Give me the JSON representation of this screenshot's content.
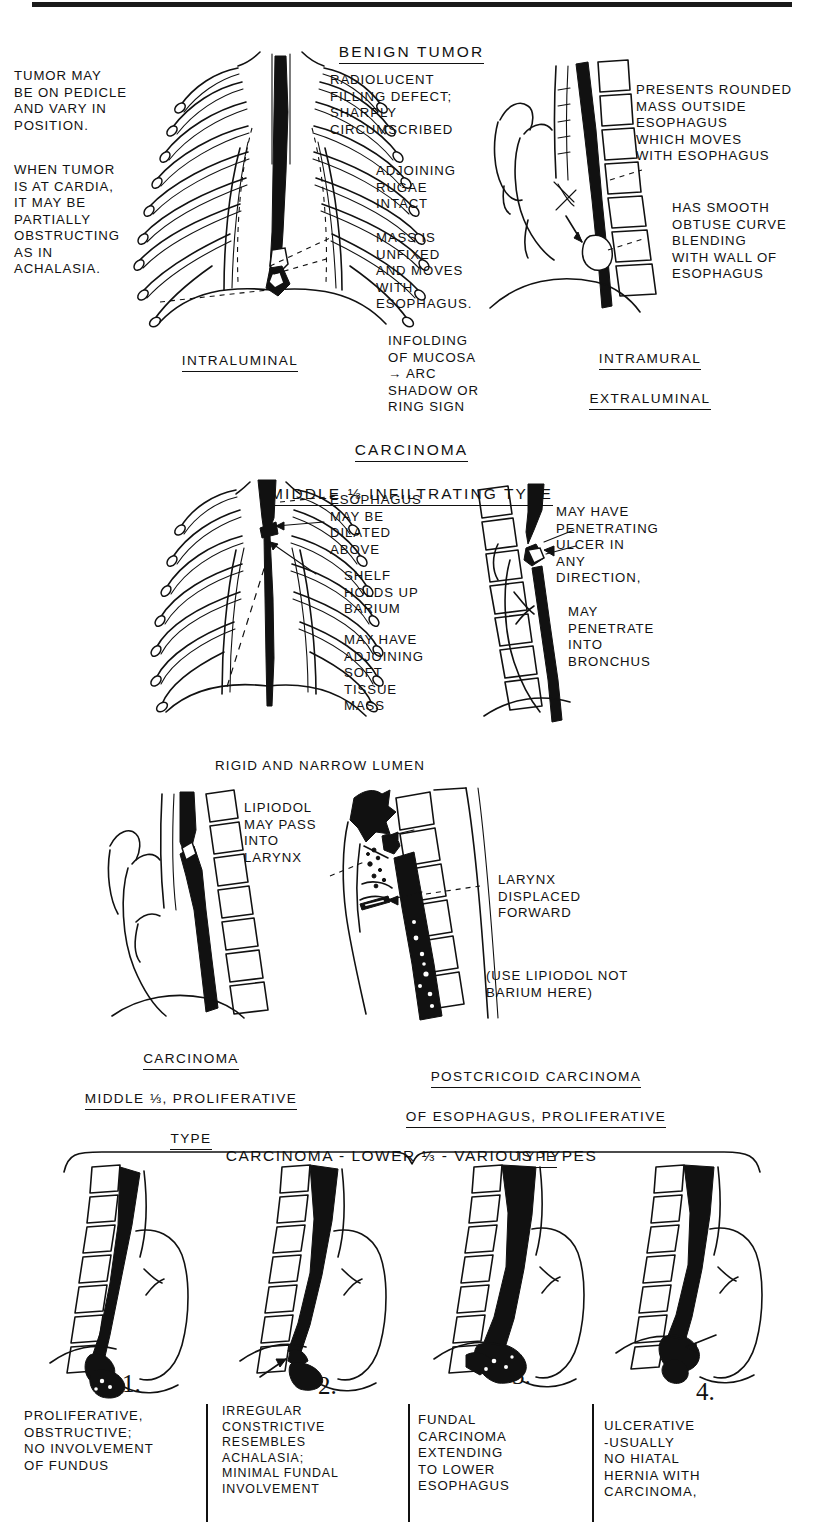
{
  "page": {
    "width": 823,
    "height": 1533,
    "ink_color": "#111111",
    "background": "#ffffff"
  },
  "sections": [
    {
      "id": "benign-tumor",
      "heading": "BENIGN  TUMOR",
      "panels": [
        {
          "id": "intraluminal",
          "caption": "INTRALUMINAL"
        },
        {
          "id": "intramural-extraluminal",
          "caption_line1": "INTRAMURAL",
          "caption_line2": "EXTRALUMINAL"
        }
      ],
      "annotations": [
        {
          "id": "tumor-pedicle",
          "text": "TUMOR MAY\nBE ON PEDICLE\nAND VARY IN\nPOSITION."
        },
        {
          "id": "tumor-cardia",
          "text": "WHEN TUMOR\nIS AT CARDIA,\nIT MAY BE\nPARTIALLY\nOBSTRUCTING\nAS IN\nACHALASIA."
        },
        {
          "id": "radiolucent",
          "text": "RADIOLUCENT\nFILLING DEFECT;\nSHARPLY\nCIRCUMSCRIBED"
        },
        {
          "id": "adjoining-rugae",
          "text": "ADJOINING\nRUGAE\nINTACT"
        },
        {
          "id": "mass-unfixed",
          "text": "MASS IS\nUNFIXED\nAND MOVES\nWITH\nESOPHAGUS."
        },
        {
          "id": "infolding-mucosa",
          "text": "INFOLDING\nOF MUCOSA\n→ ARC\nSHADOW OR\nRING SIGN"
        },
        {
          "id": "presents-rounded-mass",
          "text": "PRESENTS ROUNDED\nMASS OUTSIDE\nESOPHAGUS\nWHICH MOVES\nWITH ESOPHAGUS"
        },
        {
          "id": "smooth-obtuse-curve",
          "text": "HAS SMOOTH\nOBTUSE CURVE\nBLENDING\nWITH WALL OF\nESOPHAGUS"
        }
      ]
    },
    {
      "id": "carcinoma-middle-infiltrating",
      "heading_line1": "CARCINOMA",
      "heading_line2": "MIDDLE ⅓ INFILTRATING TYPE",
      "annotations": [
        {
          "id": "esophagus-dilated",
          "text": "ESOPHAGUS\nMAY BE\nDILATED\nABOVE"
        },
        {
          "id": "shelf-holds-barium",
          "text": "SHELF\nHOLDS UP\nBARIUM"
        },
        {
          "id": "soft-tissue-mass",
          "text": "MAY HAVE\nADJOINING\nSOFT\nTISSUE\nMASS"
        },
        {
          "id": "penetrating-ulcer",
          "text": "MAY HAVE\nPENETRATING\nULCER IN\nANY\nDIRECTION,"
        },
        {
          "id": "penetrate-bronchus",
          "text": "MAY\nPENETRATE\nINTO\nBRONCHUS"
        },
        {
          "id": "rigid-narrow-lumen",
          "text": "RIGID AND NARROW LUMEN"
        }
      ]
    },
    {
      "id": "carcinoma-proliferative",
      "panels": [
        {
          "id": "middle-third-proliferative",
          "caption_line1": "CARCINOMA",
          "caption_line2": "MIDDLE ⅓, PROLIFERATIVE",
          "caption_line3": "TYPE"
        },
        {
          "id": "postcricoid",
          "caption_line1": "POSTCRICOID CARCINOMA",
          "caption_line2": "OF ESOPHAGUS, PROLIFERATIVE",
          "caption_line3": "TYPE"
        }
      ],
      "annotations": [
        {
          "id": "lipiodol-larynx",
          "text": "LIPIODOL\nMAY PASS\nINTO\nLARYNX"
        },
        {
          "id": "larynx-displaced",
          "text": "LARYNX\nDISPLACED\nFORWARD"
        },
        {
          "id": "use-lipiodol-note",
          "text": "(USE LIPIODOL NOT\nBARIUM HERE)"
        }
      ]
    },
    {
      "id": "carcinoma-lower-third",
      "heading": "CARCINOMA - LOWER ⅓ - VARIOUS TYPES",
      "panels": [
        {
          "id": "lower-1",
          "number": "1.",
          "caption": "PROLIFERATIVE,\nOBSTRUCTIVE;\nNO INVOLVEMENT\nOF FUNDUS"
        },
        {
          "id": "lower-2",
          "number": "2.",
          "caption": "IRREGULAR\nCONSTRICTIVE\nRESEMBLES\nACHALASIA;\nMINIMAL FUNDAL\nINVOLVEMENT"
        },
        {
          "id": "lower-3",
          "number": "3.",
          "caption": "FUNDAL\nCARCINOMA\nEXTENDING\nTO LOWER\nESOPHAGUS"
        },
        {
          "id": "lower-4",
          "number": "4.",
          "caption": "ULCERATIVE\n-USUALLY\nNO HIATAL\nHERNIA WITH\nCARCINOMA,"
        }
      ]
    }
  ]
}
